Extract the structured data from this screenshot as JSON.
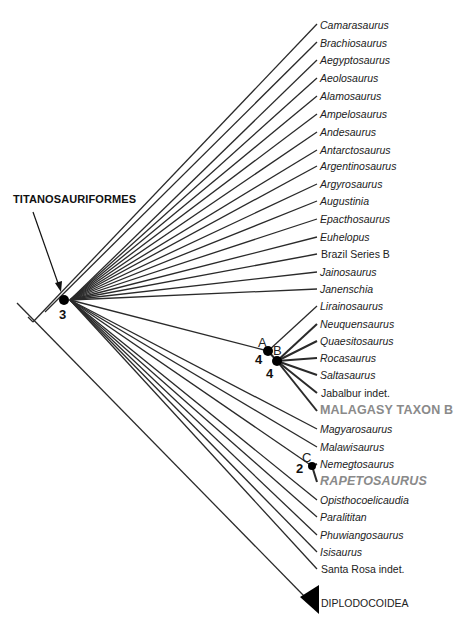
{
  "figure": {
    "type": "cladogram",
    "clade_label": "TITANOSAURIFORMES",
    "outgroup": "DIPLODOCOIDEA",
    "taxa": [
      {
        "name": "Camarasaurus",
        "style": "italic",
        "y": 19
      },
      {
        "name": "Brachiosaurus",
        "style": "italic",
        "y": 37
      },
      {
        "name": "Aegyptosaurus",
        "style": "italic",
        "y": 54
      },
      {
        "name": "Aeolosaurus",
        "style": "italic",
        "y": 72
      },
      {
        "name": "Alamosaurus",
        "style": "italic",
        "y": 90
      },
      {
        "name": "Ampelosaurus",
        "style": "italic",
        "y": 108
      },
      {
        "name": "Andesaurus",
        "style": "italic",
        "y": 126
      },
      {
        "name": "Antarctosaurus",
        "style": "italic",
        "y": 144
      },
      {
        "name": "Argentinosaurus",
        "style": "italic",
        "y": 160
      },
      {
        "name": "Argyrosaurus",
        "style": "italic",
        "y": 178
      },
      {
        "name": "Augustinia",
        "style": "italic",
        "y": 195
      },
      {
        "name": "Epacthosaurus",
        "style": "italic",
        "y": 213
      },
      {
        "name": "Euhelopus",
        "style": "italic",
        "y": 231
      },
      {
        "name": "Brazil Series B",
        "style": "normal",
        "y": 248
      },
      {
        "name": "Jainosaurus",
        "style": "italic",
        "y": 266
      },
      {
        "name": "Janenschia",
        "style": "italic",
        "y": 283
      },
      {
        "name": "Lirainosaurus",
        "style": "italic",
        "y": 300
      },
      {
        "name": "Neuquensaurus",
        "style": "italic",
        "y": 318
      },
      {
        "name": "Quaesitosaurus",
        "style": "italic",
        "y": 335
      },
      {
        "name": "Rocasaurus",
        "style": "italic",
        "y": 352
      },
      {
        "name": "Saltasaurus",
        "style": "italic",
        "y": 369
      },
      {
        "name": "Jabalbur indet.",
        "style": "normal",
        "y": 387
      },
      {
        "name": "MALAGASY TAXON B",
        "style": "big",
        "y": 405
      },
      {
        "name": "Magyarosaurus",
        "style": "italic",
        "y": 423
      },
      {
        "name": "Malawisaurus",
        "style": "italic",
        "y": 441
      },
      {
        "name": "Nemegtosaurus",
        "style": "italic",
        "y": 458
      },
      {
        "name": "RAPETOSAURUS",
        "style": "bigital",
        "y": 476
      },
      {
        "name": "Opisthocoelicaudia",
        "style": "italic",
        "y": 494
      },
      {
        "name": "Paralititan",
        "style": "italic",
        "y": 511
      },
      {
        "name": "Phuwiangosaurus",
        "style": "italic",
        "y": 529
      },
      {
        "name": "Isisaurus",
        "style": "italic",
        "y": 546
      },
      {
        "name": "Santa Rosa indet.",
        "style": "normal",
        "y": 563
      },
      {
        "name": "DIPLODOCOIDEA",
        "style": "normal",
        "y": 597
      }
    ],
    "nodes": [
      {
        "id": "titanosauriformes",
        "letter": "",
        "number": "3",
        "x": 64,
        "y": 300
      },
      {
        "id": "A",
        "letter": "A",
        "number": "4",
        "x": 268,
        "y": 351
      },
      {
        "id": "B",
        "letter": "B",
        "number": "4",
        "x": 277,
        "y": 361
      },
      {
        "id": "C",
        "letter": "C",
        "number": "2",
        "x": 312,
        "y": 466
      }
    ],
    "colors": {
      "line": "#2a2a2a",
      "node": "#000000",
      "highlight_text": "#8a8a8a"
    }
  }
}
